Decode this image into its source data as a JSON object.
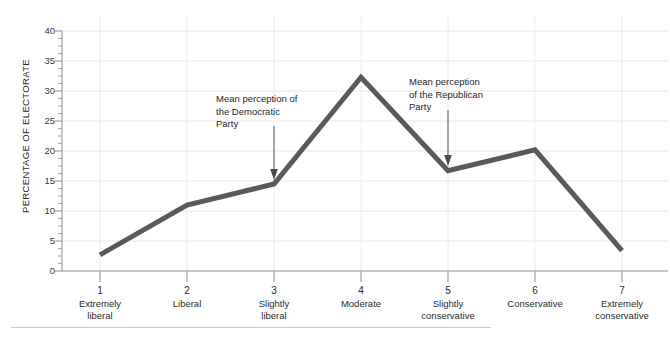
{
  "chart_data": {
    "type": "line",
    "title": "",
    "xlabel": "",
    "ylabel": "PERCENTAGE OF ELECTORATE",
    "ylim": [
      0,
      40
    ],
    "ytick_values": [
      0,
      5,
      10,
      15,
      20,
      25,
      30,
      35,
      40
    ],
    "ytick_labels": [
      "0",
      "5",
      "10",
      "15",
      "20",
      "25",
      "30",
      "35",
      "40"
    ],
    "yminor_step": 1.25,
    "grid": "horizontal",
    "legend": "none",
    "x": [
      1,
      2,
      3,
      4,
      5,
      6,
      7
    ],
    "xtick_numbers": [
      "1",
      "2",
      "3",
      "4",
      "5",
      "6",
      "7"
    ],
    "xtick_labels": [
      "Extremely\nliberal",
      "Liberal",
      "Slightly\nliberal",
      "Moderate",
      "Slightly\nconservative",
      "Conservative",
      "Extremely\nconservative"
    ],
    "values": [
      2.7,
      11.0,
      14.5,
      32.3,
      16.7,
      20.2,
      3.4
    ],
    "series": [
      {
        "name": "Percentage of electorate",
        "values": [
          2.7,
          11.0,
          14.5,
          32.3,
          16.7,
          20.2,
          3.4
        ],
        "color": "#5a5a5a",
        "line_width": 5
      }
    ],
    "annotations": [
      {
        "text": "Mean perception of the Democratic Party",
        "lines": [
          "Mean perception of",
          "the Democratic",
          "Party"
        ],
        "points_to_x": 3,
        "arrow": "down"
      },
      {
        "text": "Mean perception of the Republican Party",
        "lines": [
          "Mean perception",
          "of the Republican",
          "Party"
        ],
        "points_to_x": 5,
        "arrow": "down"
      }
    ]
  },
  "axis_labels": {
    "y0": "0",
    "y5": "5",
    "y10": "10",
    "y15": "15",
    "y20": "20",
    "y25": "25",
    "y30": "30",
    "y35": "35",
    "y40": "40",
    "y_title": "PERCENTAGE OF ELECTORATE"
  },
  "xaxis": {
    "t1_num": "1",
    "t1_l1": "Extremely",
    "t1_l2": "liberal",
    "t2_num": "2",
    "t2_l1": "Liberal",
    "t2_l2": "",
    "t3_num": "3",
    "t3_l1": "Slightly",
    "t3_l2": "liberal",
    "t4_num": "4",
    "t4_l1": "Moderate",
    "t4_l2": "",
    "t5_num": "5",
    "t5_l1": "Slightly",
    "t5_l2": "conservative",
    "t6_num": "6",
    "t6_l1": "Conservative",
    "t6_l2": "",
    "t7_num": "7",
    "t7_l1": "Extremely",
    "t7_l2": "conservative"
  },
  "annotation_left": {
    "line1": "Mean perception of",
    "line2": "the Democratic",
    "line3": "Party"
  },
  "annotation_right": {
    "line1": "Mean perception",
    "line2": "of the Republican",
    "line3": "Party"
  },
  "colors": {
    "line": "#5a5a5a",
    "grid": "#e8e8e8",
    "axis": "#8c8c8c",
    "text": "#2b2b2b",
    "rule": "#c9c9c9"
  }
}
